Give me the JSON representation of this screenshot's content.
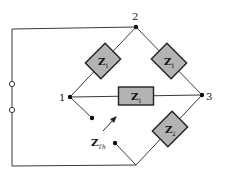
{
  "diagram": {
    "type": "bridge-circuit",
    "nodes": {
      "node_2": "2",
      "node_1": "1",
      "node_3": "3"
    },
    "impedances": {
      "top_left": {
        "symbol": "Z",
        "subscript": "1"
      },
      "top_right": {
        "symbol": "Z",
        "subscript": "1"
      },
      "middle": {
        "symbol": "Z",
        "subscript": "1"
      },
      "bottom_right": {
        "symbol": "Z",
        "subscript": "2"
      }
    },
    "thevenin_label": {
      "symbol": "Z",
      "subscript": "Th"
    },
    "colors": {
      "impedance_fill": "#b3b3b3",
      "wire": "#3a3a3a",
      "background": "#ffffff"
    }
  }
}
